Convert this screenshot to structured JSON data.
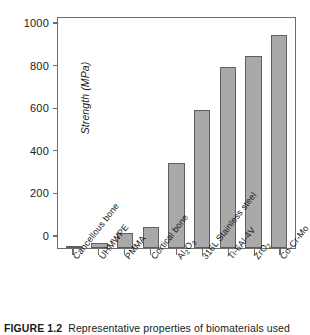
{
  "chart_data": {
    "type": "bar",
    "title": "",
    "xlabel": "",
    "ylabel": "Strength (MPa)",
    "ylim": [
      0,
      1080
    ],
    "yticks": [
      0,
      200,
      400,
      600,
      800,
      1000
    ],
    "ytick_labels": [
      "0",
      "200",
      "400",
      "600",
      "800",
      "1000"
    ],
    "grid": false,
    "legend": null,
    "bar_color": "#a9a9a9",
    "bar_edge_color": "#5e5e5e",
    "categories": [
      "Cancellous bone",
      "UHMWPE",
      "PMMA",
      "Cortical bone",
      "Al2O3",
      "316L Stainless steel",
      "Ti-6Al-4V",
      "ZrO2",
      "Co-Cr-Mo"
    ],
    "category_labels_rich": [
      {
        "pre": "Cancellous bone",
        "sub": "",
        "post": ""
      },
      {
        "pre": "UHMWPE",
        "sub": "",
        "post": ""
      },
      {
        "pre": "PMMA",
        "sub": "",
        "post": ""
      },
      {
        "pre": "Cortical bone",
        "sub": "",
        "post": ""
      },
      {
        "pre": "Al",
        "sub": "2",
        "post": "O",
        "sub2": "3"
      },
      {
        "pre": "316L Stainless steel",
        "sub": "",
        "post": ""
      },
      {
        "pre": "Ti-6Al-4V",
        "sub": "",
        "post": ""
      },
      {
        "pre": "ZrO",
        "sub": "2",
        "post": ""
      },
      {
        "pre": "Co-Cr-Mo",
        "sub": "",
        "post": ""
      }
    ],
    "values": [
      2,
      25,
      70,
      100,
      400,
      650,
      850,
      900,
      1000
    ]
  },
  "caption": {
    "number": "FIGURE 1.2",
    "text": "Representative properties of biomaterials used"
  }
}
